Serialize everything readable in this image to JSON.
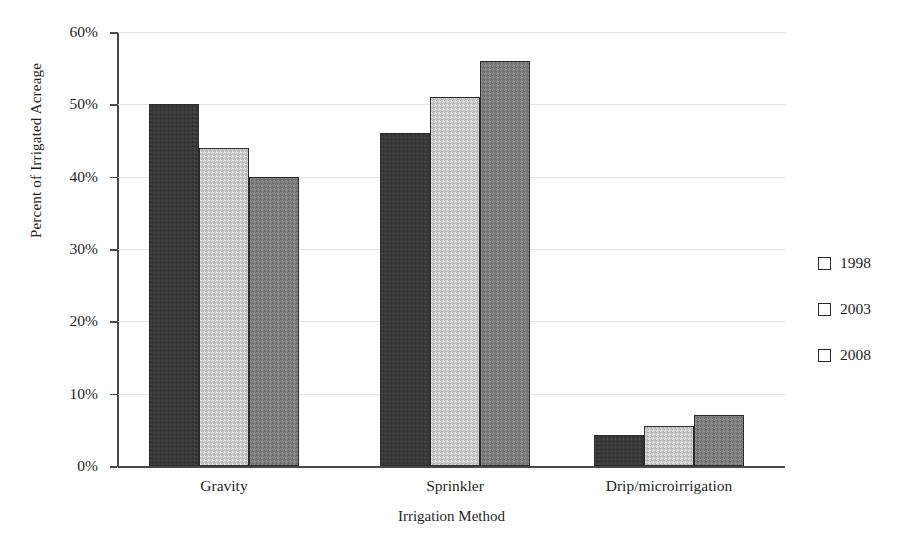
{
  "chart_data": {
    "type": "bar",
    "title": "",
    "subtitle": "",
    "xlabel": "Irrigation Method",
    "ylabel": "Percent of Irrigated Acreage",
    "categories": [
      "Gravity",
      "Sprinkler",
      "Drip/microirrigation"
    ],
    "series": [
      {
        "name": "1998",
        "color": "#3a3a3a",
        "values": [
          50,
          46,
          4.3
        ]
      },
      {
        "name": "2003",
        "color": "#c8c8c8",
        "values": [
          44,
          51,
          5.6
        ]
      },
      {
        "name": "2008",
        "color": "#7d7d7d",
        "values": [
          40,
          56,
          7.1
        ]
      }
    ],
    "ylim": [
      0,
      60
    ],
    "ytick_values": [
      0,
      10,
      20,
      30,
      40,
      50,
      60
    ],
    "ytick_labels": [
      "0%",
      "10%",
      "20%",
      "30%",
      "40%",
      "50%",
      "60%"
    ],
    "grid": "horizontal",
    "legend_position": "right",
    "legend_entries": [
      "1998",
      "2003",
      "2008"
    ],
    "annotations": []
  },
  "axes": {
    "y_title": "Percent of Irrigated Acreage",
    "x_title": "Irrigation Method"
  }
}
